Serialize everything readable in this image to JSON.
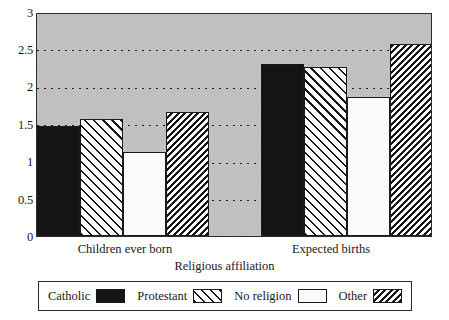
{
  "chart_data": {
    "type": "bar",
    "title": "",
    "subtitle": "",
    "xlabel": "Religious affiliation",
    "ylabel": "",
    "categories": [
      "Children ever born",
      "Expected births"
    ],
    "series": [
      {
        "name": "Catholic",
        "pattern": "solid",
        "values": [
          1.49,
          2.33
        ]
      },
      {
        "name": "Protestant",
        "pattern": "hatch-wide",
        "values": [
          1.58,
          2.28
        ]
      },
      {
        "name": "No religion",
        "pattern": "open",
        "values": [
          1.13,
          1.88
        ]
      },
      {
        "name": "Other",
        "pattern": "hatch-dense",
        "values": [
          1.67,
          2.59
        ]
      }
    ],
    "ylim": [
      0,
      3
    ],
    "ytick_labels": [
      "0",
      "0.5",
      "1",
      "1.5",
      "2",
      "2.5",
      "3"
    ],
    "ytick_values": [
      0,
      0.5,
      1,
      1.5,
      2,
      2.5,
      3
    ],
    "grid": true,
    "grid_style": "dotted",
    "grid_axis": "y",
    "legend_position": "bottom",
    "plot_background": "#c8c8c8",
    "bar_edge_color": "#1a1a1a",
    "axes_color": "#2b2b2b"
  },
  "legend": {
    "items": [
      {
        "label": "Catholic"
      },
      {
        "label": "Protestant"
      },
      {
        "label": "No religion"
      },
      {
        "label": "Other"
      }
    ]
  }
}
